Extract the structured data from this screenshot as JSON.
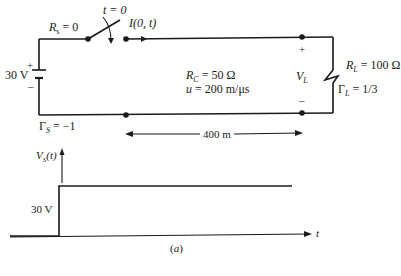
{
  "circuit": {
    "source_resistance": {
      "symbol": "R",
      "sub": "s",
      "value": " = 0"
    },
    "switch_time": "t = 0",
    "current_label": "I(0, t)",
    "source_voltage": "30 V",
    "source_plus": "+",
    "source_minus": "–",
    "gamma_source": {
      "symbol": "Γ",
      "sub": "S",
      "value": " = −1"
    },
    "line_impedance": {
      "symbol": "R",
      "sub": "C",
      "value": " = 50 Ω"
    },
    "velocity": {
      "symbol": "u",
      "value": " = 200 m/μs"
    },
    "load_voltage": {
      "symbol": "V",
      "sub": "L"
    },
    "load_plus": "+",
    "load_minus": "–",
    "load_resistance": {
      "symbol": "R",
      "sub": "L",
      "value": " = 100 Ω"
    },
    "gamma_load": {
      "symbol": "Γ",
      "sub": "L",
      "value": " = 1/3"
    },
    "length_label": "400 m"
  },
  "graph": {
    "y_axis_label": {
      "symbol": "V",
      "sub": "S",
      "suffix": "(t)"
    },
    "x_axis_label": "t",
    "step_label": "30 V",
    "caption": "(a)"
  },
  "chart_data": {
    "type": "line",
    "title": "",
    "xlabel": "t",
    "ylabel": "V_S(t)",
    "x": [
      -1,
      0,
      0,
      5
    ],
    "y": [
      0,
      0,
      30,
      30
    ],
    "annotations": [
      "30 V"
    ],
    "caption": "(a)"
  }
}
